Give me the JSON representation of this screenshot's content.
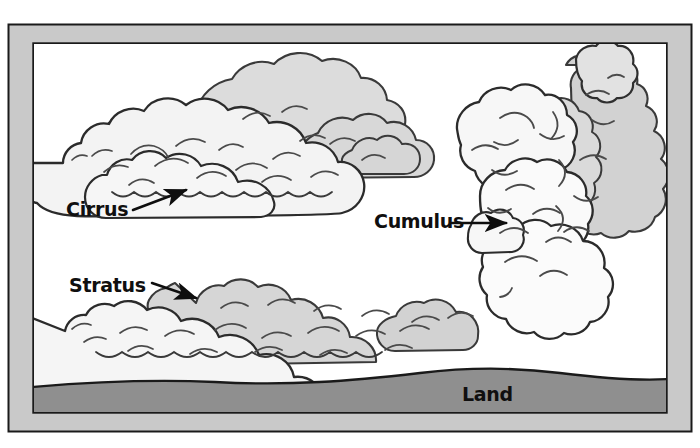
{
  "diagram": {
    "background_color": "#ffffff",
    "frame": {
      "name": "picture-frame",
      "band_color": "#c9c9c9",
      "line_color": "#1a1a1a",
      "outer": {
        "x": 8,
        "y": 24,
        "width": 684,
        "height": 408
      },
      "inner": {
        "x": 33,
        "y": 43,
        "width": 634,
        "height": 370
      }
    },
    "sky": {
      "name": "sky-area",
      "color": "#ffffff"
    },
    "land": {
      "name": "land-area",
      "label": "Land",
      "fill_color": "#8f8f8f",
      "outline_color": "#1a1a1a",
      "label_x": 462,
      "label_y": 401
    },
    "clouds": [
      {
        "id": "cirrus",
        "label": "Cirrus",
        "label_x": 66,
        "label_y": 216,
        "arrow_from": [
          133,
          210
        ],
        "arrow_to": [
          196,
          186
        ],
        "fill_light": "#f2f2f2",
        "fill_shade": "#d8d8d8",
        "outline_color": "#2b2b2b"
      },
      {
        "id": "cumulus",
        "label": "Cumulus",
        "label_x": 374,
        "label_y": 228,
        "arrow_from": [
          449,
          223
        ],
        "arrow_to": [
          515,
          223
        ],
        "fill_light": "#f7f7f7",
        "fill_shade": "#d0d0d0",
        "outline_color": "#2b2b2b"
      },
      {
        "id": "stratus",
        "label": "Stratus",
        "label_x": 69,
        "label_y": 292,
        "arrow_from": [
          152,
          283
        ],
        "arrow_to": [
          205,
          302
        ],
        "fill_light": "#f4f4f4",
        "fill_shade": "#d4d4d4",
        "outline_color": "#2b2b2b"
      }
    ]
  }
}
